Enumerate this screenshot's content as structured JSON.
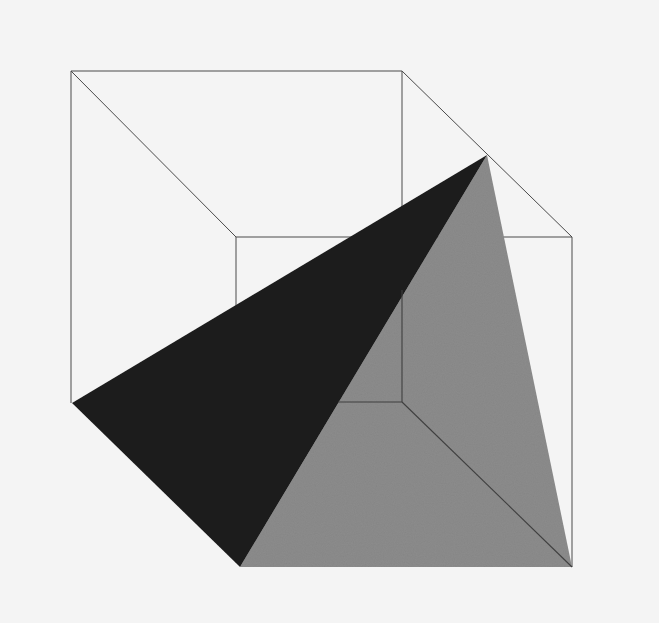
{
  "artwork": {
    "background": "#f4f4f4",
    "colors": {
      "dark_face": "#1c1c1c",
      "gray_face": "#8c8c8c",
      "line": "#4a4a4a"
    },
    "cube": {
      "front_square": {
        "x1": 71,
        "y1": 71,
        "x2": 402,
        "y2": 402
      },
      "back_square": {
        "x1": 236,
        "y1": 237,
        "x2": 572,
        "y2": 567
      }
    },
    "tetrahedron": {
      "apex": [
        487,
        155
      ],
      "left": [
        72,
        403
      ],
      "bottom": [
        240,
        567
      ],
      "right": [
        572,
        567
      ]
    }
  }
}
